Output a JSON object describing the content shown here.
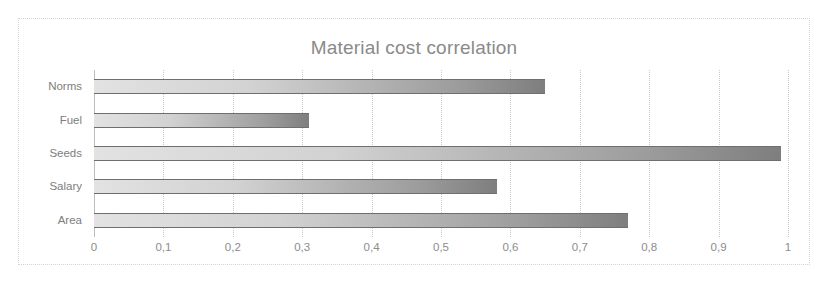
{
  "chart_data": {
    "type": "bar",
    "orientation": "horizontal",
    "title": "Material cost correlation",
    "xlabel": "",
    "ylabel": "",
    "categories": [
      "Norms",
      "Fuel",
      "Seeds",
      "Salary",
      "Area"
    ],
    "values": [
      0.65,
      0.31,
      0.99,
      0.58,
      0.77
    ],
    "xlim": [
      0,
      1
    ],
    "xticks": [
      0,
      0.1,
      0.2,
      0.3,
      0.4,
      0.5,
      0.6,
      0.7,
      0.8,
      0.9,
      1
    ],
    "xtick_labels": [
      "0",
      "0,1",
      "0,2",
      "0,3",
      "0,4",
      "0,5",
      "0,6",
      "0,7",
      "0,8",
      "0,9",
      "1"
    ],
    "grid": "vertical-dotted",
    "legend": null,
    "series": [
      {
        "name": "Material cost correlation",
        "values": [
          0.65,
          0.31,
          0.99,
          0.58,
          0.77
        ]
      }
    ],
    "colors": {
      "bar_gradient_start": "#e2e2e2",
      "bar_gradient_end": "#7e7e7e",
      "bar_edge": "#6f6f6f",
      "title_text": "#8a8a8a",
      "tick_text": "#8c8c8c",
      "gridline": "#c9c9c9",
      "frame_border": "#d2d2d2",
      "background": "#ffffff"
    }
  }
}
